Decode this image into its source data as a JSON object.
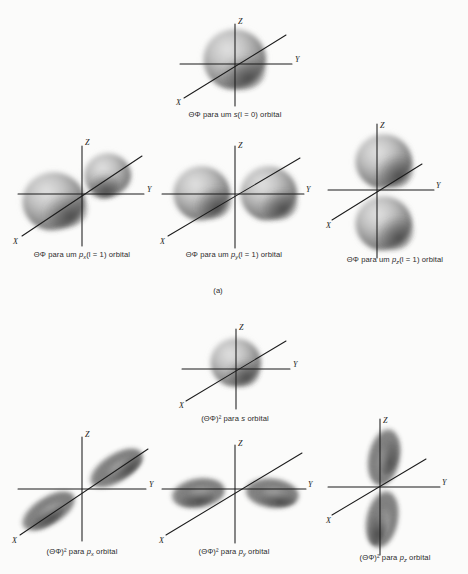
{
  "figure": {
    "background_color": "#fbfbfa",
    "ink_color": "#1b1b1b",
    "cloud_color": "#4a4a4a"
  },
  "axes": {
    "x_label": "X",
    "y_label": "Y",
    "z_label": "Z"
  },
  "panels": [
    {
      "id": "a",
      "label": "(a)",
      "cells": [
        {
          "id": "a-s",
          "caption_prefix": "ΘΦ para um ",
          "caption_symbol": "s",
          "caption_suffix": "(l = 0) orbital",
          "caption_subscript": "",
          "orbital": "s",
          "quantum_l": "0"
        },
        {
          "id": "a-px",
          "caption_prefix": "ΘΦ para um ",
          "caption_symbol": "p",
          "caption_subscript": "x",
          "caption_suffix": "(l = 1) orbital",
          "orbital": "px",
          "quantum_l": "1"
        },
        {
          "id": "a-py",
          "caption_prefix": "ΘΦ para um ",
          "caption_symbol": "p",
          "caption_subscript": "y",
          "caption_suffix": "(l = 1) orbital",
          "orbital": "py",
          "quantum_l": "1"
        },
        {
          "id": "a-pz",
          "caption_prefix": "ΘΦ para um ",
          "caption_symbol": "p",
          "caption_subscript": "z",
          "caption_suffix": "(l = 1) orbital",
          "orbital": "pz",
          "quantum_l": "1"
        }
      ]
    },
    {
      "id": "b",
      "label": "",
      "cells": [
        {
          "id": "b-s",
          "caption_prefix": "(ΘΦ)² para ",
          "caption_symbol": "s",
          "caption_subscript": "",
          "caption_suffix": " orbital",
          "orbital": "s2"
        },
        {
          "id": "b-px",
          "caption_prefix": "(ΘΦ)² para ",
          "caption_symbol": "p",
          "caption_subscript": "x",
          "caption_suffix": " orbital",
          "orbital": "px2"
        },
        {
          "id": "b-py",
          "caption_prefix": "(ΘΦ)² para ",
          "caption_symbol": "p",
          "caption_subscript": "y",
          "caption_suffix": " orbital",
          "orbital": "py2"
        },
        {
          "id": "b-pz",
          "caption_prefix": "(ΘΦ)² para ",
          "caption_symbol": "p",
          "caption_subscript": "z",
          "caption_suffix": " orbital",
          "orbital": "pz2"
        }
      ]
    }
  ]
}
